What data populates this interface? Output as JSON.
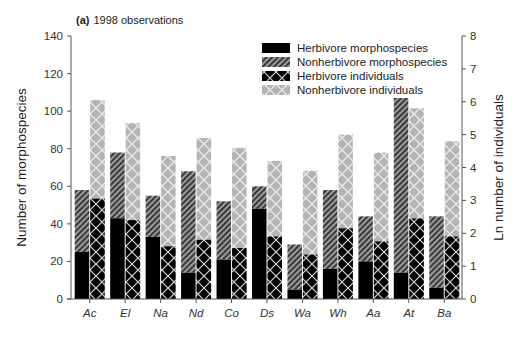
{
  "chart_data": {
    "type": "bar",
    "title_prefix": "(a)",
    "title": "1998 observations",
    "xlabel": "",
    "ylabel": "Number of morphospecies",
    "y2label": "Ln number of individuals",
    "ylim": [
      0,
      140
    ],
    "y2lim": [
      0,
      8
    ],
    "yticks": [
      0,
      20,
      40,
      60,
      80,
      100,
      120,
      140
    ],
    "y2ticks": [
      0,
      1,
      2,
      3,
      4,
      5,
      6,
      7,
      8
    ],
    "grid": false,
    "legend_position": "upper right",
    "categories": [
      "Ac",
      "El",
      "Na",
      "Nd",
      "Co",
      "Ds",
      "Wa",
      "Wh",
      "Aa",
      "At",
      "Ba"
    ],
    "series": [
      {
        "name": "Herbivore morphospecies",
        "axis": "left",
        "stack": "morphospecies",
        "pattern": "solid-black",
        "values": [
          25,
          43,
          33,
          14,
          21,
          48,
          5,
          16,
          20,
          14,
          6
        ]
      },
      {
        "name": "Nonherbivore morphospecies",
        "axis": "left",
        "stack": "morphospecies",
        "pattern": "diagonal-hatch",
        "values": [
          33,
          35,
          22,
          54,
          31,
          12,
          24,
          42,
          24,
          93,
          38
        ]
      },
      {
        "name": "Herbivore individuals",
        "axis": "right",
        "stack": "individuals",
        "pattern": "black-crosshatch",
        "values": [
          3.05,
          2.4,
          1.6,
          1.8,
          1.55,
          1.9,
          1.35,
          2.15,
          1.75,
          2.45,
          1.9
        ]
      },
      {
        "name": "Nonherbivore individuals",
        "axis": "right",
        "stack": "individuals",
        "pattern": "grey-crosshatch",
        "values": [
          6.05,
          5.35,
          4.35,
          4.9,
          4.6,
          4.2,
          3.9,
          5.0,
          4.45,
          5.8,
          4.8
        ]
      }
    ]
  }
}
